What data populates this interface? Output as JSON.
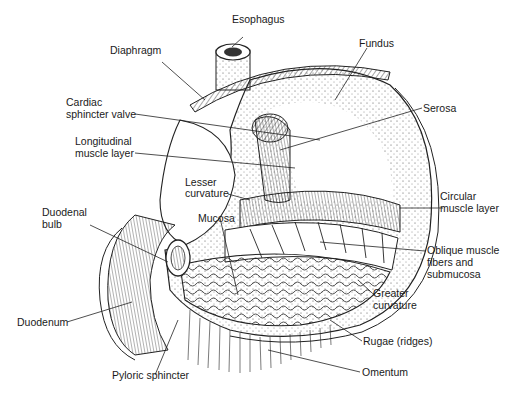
{
  "diagram": {
    "labels": {
      "esophagus": "Esophagus",
      "diaphragm": "Diaphragm",
      "fundus": "Fundus",
      "cardiac_sphincter_1": "Cardiac",
      "cardiac_sphincter_2": "sphincter valve",
      "serosa": "Serosa",
      "longitudinal_1": "Longitudinal",
      "longitudinal_2": "muscle layer",
      "lesser_curvature_1": "Lesser",
      "lesser_curvature_2": "curvature",
      "circular_1": "Circular",
      "circular_2": "muscle layer",
      "duodenal_bulb_1": "Duodenal",
      "duodenal_bulb_2": "bulb",
      "mucosa": "Mucosa",
      "oblique_1": "Oblique muscle",
      "oblique_2": "fibers and",
      "oblique_3": "submucosa",
      "greater_curvature_1": "Greater",
      "greater_curvature_2": "curvature",
      "duodenum": "Duodenum",
      "rugae": "Rugae (ridges)",
      "pyloric_sphincter": "Pyloric sphincter",
      "omentum": "Omentum"
    },
    "colors": {
      "ink": "#1a1a1a",
      "background": "#ffffff"
    }
  }
}
